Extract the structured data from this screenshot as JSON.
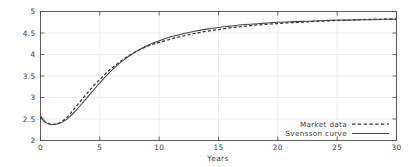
{
  "chart_data": {
    "type": "line",
    "title": "",
    "xlabel": "Years",
    "ylabel": "",
    "xlim": [
      0,
      30
    ],
    "ylim": [
      2,
      5
    ],
    "grid": true,
    "legend_position": "bottom-right",
    "xticks": [
      "0",
      "5",
      "10",
      "15",
      "20",
      "25",
      "30"
    ],
    "xtick_values": [
      0,
      5,
      10,
      15,
      20,
      25,
      30
    ],
    "yticks": [
      "2",
      "2.5",
      "3",
      "3.5",
      "4",
      "4.5",
      "5"
    ],
    "ytick_values": [
      2,
      2.5,
      3,
      3.5,
      4,
      4.5,
      5
    ],
    "x": [
      0,
      0.25,
      0.5,
      0.75,
      1,
      1.5,
      2,
      2.5,
      3,
      3.5,
      4,
      4.5,
      5,
      5.5,
      6,
      6.5,
      7,
      7.5,
      8,
      8.5,
      9,
      9.5,
      10,
      11,
      12,
      13,
      14,
      15,
      16,
      17,
      18,
      19,
      20,
      21,
      22,
      23,
      24,
      25,
      26,
      27,
      28,
      29,
      30
    ],
    "series": [
      {
        "name": "Market data",
        "style": "dashed",
        "color": "#333333",
        "values": [
          2.57,
          2.47,
          2.42,
          2.39,
          2.37,
          2.4,
          2.48,
          2.62,
          2.79,
          2.96,
          3.12,
          3.28,
          3.42,
          3.56,
          3.68,
          3.79,
          3.89,
          3.98,
          4.06,
          4.13,
          4.19,
          4.24,
          4.28,
          4.36,
          4.43,
          4.49,
          4.54,
          4.58,
          4.62,
          4.65,
          4.68,
          4.7,
          4.72,
          4.74,
          4.75,
          4.77,
          4.78,
          4.79,
          4.8,
          4.81,
          4.82,
          4.82,
          4.83
        ]
      },
      {
        "name": "Svensson curve",
        "style": "solid",
        "color": "#444444",
        "values": [
          2.55,
          2.46,
          2.41,
          2.38,
          2.37,
          2.39,
          2.45,
          2.56,
          2.7,
          2.86,
          3.02,
          3.18,
          3.34,
          3.49,
          3.63,
          3.76,
          3.87,
          3.97,
          4.06,
          4.14,
          4.21,
          4.27,
          4.32,
          4.41,
          4.48,
          4.54,
          4.59,
          4.63,
          4.66,
          4.69,
          4.71,
          4.73,
          4.75,
          4.76,
          4.77,
          4.78,
          4.79,
          4.8,
          4.8,
          4.81,
          4.81,
          4.82,
          4.82
        ]
      }
    ],
    "legend": [
      {
        "label": "Market data",
        "style": "dashed"
      },
      {
        "label": "Svensson curve",
        "style": "solid"
      }
    ]
  },
  "colors": {
    "background": "#ffffff",
    "axis": "#4a4a4a",
    "grid": "#e2e2e6",
    "market_data": "#333333",
    "svensson_curve": "#444444"
  }
}
